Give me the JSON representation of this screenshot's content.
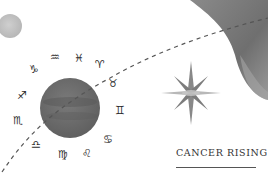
{
  "title": "CANCER RISING",
  "zodiac_signs": [
    {
      "name": "capricorn",
      "glyph": "♑",
      "x": 34,
      "y": 69
    },
    {
      "name": "aquarius",
      "glyph": "♒",
      "x": 55,
      "y": 57
    },
    {
      "name": "pisces",
      "glyph": "♓",
      "x": 79,
      "y": 58
    },
    {
      "name": "aries",
      "glyph": "♈",
      "x": 100,
      "y": 64
    },
    {
      "name": "taurus",
      "glyph": "♉",
      "x": 113,
      "y": 83
    },
    {
      "name": "gemini",
      "glyph": "♊",
      "x": 120,
      "y": 110
    },
    {
      "name": "cancer",
      "glyph": "♋",
      "x": 108,
      "y": 139
    },
    {
      "name": "leo",
      "glyph": "♌",
      "x": 87,
      "y": 153
    },
    {
      "name": "virgo",
      "glyph": "♍",
      "x": 63,
      "y": 154
    },
    {
      "name": "libra",
      "glyph": "♎",
      "x": 36,
      "y": 144
    },
    {
      "name": "scorpio",
      "glyph": "♏",
      "x": 18,
      "y": 120
    },
    {
      "name": "sagittarius",
      "glyph": "♐",
      "x": 22,
      "y": 95
    }
  ],
  "colors": {
    "planet": "#6e6e6e",
    "planet_band": "#5a5a5a",
    "moon": "#c4c4c4",
    "blob": "#7a7a7a",
    "blob_light": "#a9a9a9",
    "star": "#8a8a8a",
    "dashes": "#555555"
  }
}
